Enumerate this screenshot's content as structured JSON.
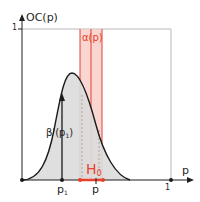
{
  "diagram": {
    "y_axis_label": "OC(p)",
    "y_tick_one": "1",
    "x_axis_label": "p",
    "x_tick_one": "1",
    "band_label": "α(p)",
    "hypothesis_label_main": "H",
    "hypothesis_label_sub": "0",
    "beta_label_main": "β'(p",
    "beta_label_sub": "1",
    "beta_label_close": ")",
    "p1_label_main": "p",
    "p1_label_sub": "1",
    "p_label": "p",
    "colors": {
      "axis": "#1f1f1f",
      "frame": "#b8b8b8",
      "curve": "#1a1a1a",
      "curve_fill": "#dcdcdc",
      "band_fill": "#f9cfca",
      "band_line": "#e8412c",
      "h0": "#e8412c",
      "dotted": "#9a9a9a"
    }
  }
}
